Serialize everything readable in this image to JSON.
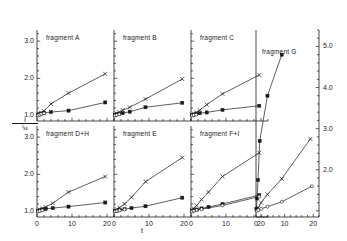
{
  "figure": {
    "xlabel": "t",
    "ylabel_numerator": "i",
    "ylabel_denominator": "i",
    "ylabel_denominator_sub": "ss"
  },
  "chart_data": {
    "type": "scatter",
    "title": "",
    "xlabel": "t",
    "ylabel": "i / i_ss",
    "grid": false,
    "legend_position": "none",
    "xlim": [
      0,
      22
    ],
    "ylim": [
      0.85,
      3.3
    ],
    "xticks": [
      0,
      10,
      20
    ],
    "xticklabels": [
      "0",
      "10",
      "20"
    ],
    "yticks": [
      1.0,
      2.0,
      3.0
    ],
    "yticklabels": [
      "1.0",
      "2.0",
      "3.0"
    ],
    "right_axis": {
      "ylim": [
        0.85,
        5.4
      ],
      "yticks": [
        2.0,
        3.0,
        4.0,
        5.0
      ],
      "yticklabels": [
        "2.0",
        "3.0",
        "4.0",
        "5.0"
      ]
    },
    "panels": [
      {
        "label": "fragment A",
        "row": 0,
        "col": 0,
        "axis": "left",
        "series": [
          {
            "name": "cross",
            "marker": "x",
            "x": [
              0.3,
              0.7,
              1.2,
              2.0,
              4.0,
              9.0,
              19.5
            ],
            "y": [
              1.02,
              1.05,
              1.07,
              1.12,
              1.31,
              1.6,
              2.12
            ]
          },
          {
            "name": "square",
            "marker": "s",
            "x": [
              0.3,
              0.7,
              1.2,
              2.0,
              4.0,
              9.0,
              19.5
            ],
            "y": [
              1.01,
              1.03,
              1.05,
              1.07,
              1.09,
              1.13,
              1.35
            ]
          },
          {
            "name": "open",
            "marker": "o",
            "x": [
              0.3,
              0.7,
              1.2,
              2.0
            ],
            "y": [
              1.0,
              1.02,
              1.04,
              1.06
            ]
          }
        ]
      },
      {
        "label": "fragment B",
        "row": 0,
        "col": 1,
        "axis": "left",
        "series": [
          {
            "name": "cross",
            "marker": "x",
            "x": [
              0.3,
              0.8,
              1.5,
              2.5,
              4.5,
              9.0,
              19.5
            ],
            "y": [
              1.02,
              1.05,
              1.09,
              1.14,
              1.22,
              1.44,
              1.98
            ]
          },
          {
            "name": "square",
            "marker": "s",
            "x": [
              0.3,
              0.8,
              1.5,
              2.5,
              4.5,
              9.0,
              19.5
            ],
            "y": [
              1.01,
              1.03,
              1.04,
              1.06,
              1.1,
              1.22,
              1.34
            ]
          },
          {
            "name": "open",
            "marker": "o",
            "x": [
              0.3,
              0.8,
              1.5
            ],
            "y": [
              1.0,
              1.01,
              1.03
            ]
          }
        ]
      },
      {
        "label": "fragment C",
        "row": 0,
        "col": 2,
        "axis": "left",
        "series": [
          {
            "name": "cross",
            "marker": "x",
            "x": [
              0.3,
              0.8,
              1.5,
              2.5,
              4.5,
              9.0,
              19.5
            ],
            "y": [
              1.02,
              1.05,
              1.08,
              1.14,
              1.29,
              1.58,
              2.09
            ]
          },
          {
            "name": "square",
            "marker": "s",
            "x": [
              0.3,
              0.8,
              1.5,
              2.5,
              4.5,
              9.0,
              19.5
            ],
            "y": [
              1.01,
              1.02,
              1.04,
              1.06,
              1.08,
              1.15,
              1.26
            ]
          },
          {
            "name": "open",
            "marker": "o",
            "x": [
              0.3,
              0.8,
              1.5
            ],
            "y": [
              1.0,
              1.01,
              1.02
            ]
          }
        ]
      },
      {
        "label": "fragment G",
        "row": 0,
        "col": 3,
        "axis": "right",
        "tall": true,
        "series": [
          {
            "name": "square-steep",
            "marker": "s",
            "x": [
              0.15,
              0.35,
              0.7,
              1.3,
              4.0,
              9.0
            ],
            "y": [
              1.05,
              1.3,
              1.75,
              2.7,
              3.8,
              4.8
            ]
          },
          {
            "name": "cross",
            "marker": "x",
            "x": [
              0.3,
              0.8,
              1.8,
              4.0,
              9.0,
              19.0
            ],
            "y": [
              1.02,
              1.08,
              1.2,
              1.4,
              1.78,
              2.75
            ]
          },
          {
            "name": "open",
            "marker": "o",
            "x": [
              0.3,
              0.8,
              1.8,
              4.0,
              9.0,
              19.5
            ],
            "y": [
              1.0,
              1.02,
              1.05,
              1.1,
              1.22,
              1.6
            ]
          }
        ]
      },
      {
        "label": "fragment D+H",
        "row": 1,
        "col": 0,
        "axis": "left",
        "series": [
          {
            "name": "cross",
            "marker": "x",
            "x": [
              0.3,
              0.8,
              1.5,
              2.5,
              4.5,
              9.0,
              19.5
            ],
            "y": [
              1.02,
              1.05,
              1.08,
              1.12,
              1.22,
              1.52,
              1.94
            ]
          },
          {
            "name": "square",
            "marker": "s",
            "x": [
              0.3,
              0.8,
              1.5,
              2.5,
              4.5,
              9.0,
              19.5
            ],
            "y": [
              1.01,
              1.03,
              1.05,
              1.07,
              1.09,
              1.13,
              1.24
            ]
          },
          {
            "name": "open",
            "marker": "o",
            "x": [
              0.3,
              0.8,
              1.5
            ],
            "y": [
              1.0,
              1.01,
              1.03
            ]
          }
        ]
      },
      {
        "label": "fragment E",
        "row": 1,
        "col": 1,
        "axis": "left",
        "series": [
          {
            "name": "cross",
            "marker": "x",
            "x": [
              0.3,
              0.8,
              1.6,
              3.0,
              5.0,
              9.0,
              19.5
            ],
            "y": [
              1.02,
              1.06,
              1.1,
              1.2,
              1.38,
              1.8,
              2.45
            ]
          },
          {
            "name": "square",
            "marker": "s",
            "x": [
              0.3,
              0.8,
              1.6,
              3.0,
              5.0,
              9.0,
              19.5
            ],
            "y": [
              1.01,
              1.02,
              1.04,
              1.06,
              1.09,
              1.14,
              1.37
            ]
          },
          {
            "name": "open",
            "marker": "o",
            "x": [
              0.3,
              0.8,
              1.6,
              3.0
            ],
            "y": [
              1.0,
              1.01,
              1.03,
              1.05
            ]
          }
        ]
      },
      {
        "label": "fragment F+I",
        "row": 1,
        "col": 2,
        "axis": "left",
        "series": [
          {
            "name": "cross",
            "marker": "x",
            "x": [
              0.3,
              0.8,
              1.6,
              3.0,
              5.0,
              9.0,
              19.5
            ],
            "y": [
              1.03,
              1.08,
              1.16,
              1.32,
              1.52,
              1.94,
              2.58
            ]
          },
          {
            "name": "square",
            "marker": "s",
            "x": [
              0.3,
              0.8,
              1.6,
              3.0,
              5.0,
              9.0,
              19.5
            ],
            "y": [
              1.01,
              1.03,
              1.05,
              1.08,
              1.12,
              1.2,
              1.44
            ]
          },
          {
            "name": "open",
            "marker": "o",
            "x": [
              0.3,
              0.8,
              1.6,
              3.0,
              9.0,
              19.5
            ],
            "y": [
              1.0,
              1.02,
              1.04,
              1.06,
              1.16,
              1.4
            ]
          }
        ]
      }
    ]
  }
}
